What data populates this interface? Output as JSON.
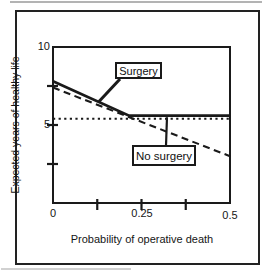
{
  "colors": {
    "ink": "#1a1a1a",
    "background": "#ffffff"
  },
  "chart_data": {
    "type": "line",
    "title": "",
    "xlabel": "Probability of operative death",
    "ylabel": "Expected years of healthy life",
    "xlim": [
      0,
      0.5
    ],
    "ylim": [
      0,
      10
    ],
    "grid": false,
    "legend_position": "inline-callouts",
    "x_axis": {
      "ticks": [
        {
          "value": 0,
          "label": "0"
        },
        {
          "value": 0.125,
          "label": ""
        },
        {
          "value": 0.25,
          "label": "0.25"
        },
        {
          "value": 0.375,
          "label": ""
        },
        {
          "value": 0.5,
          "label": "0.5"
        }
      ]
    },
    "y_axis": {
      "ticks": [
        {
          "value": 10,
          "label": "10"
        },
        {
          "value": 7.5,
          "label": ""
        },
        {
          "value": 5,
          "label": "5"
        },
        {
          "value": 2.5,
          "label": ""
        }
      ]
    },
    "series": [
      {
        "name": "surgery-dashed",
        "label": "Surgery",
        "line_style": "dashed",
        "points": [
          [
            0,
            7.4
          ],
          [
            0.5,
            3.0
          ]
        ]
      },
      {
        "name": "surgery-solid",
        "label": "Surgery",
        "line_style": "solid",
        "points": [
          [
            0,
            7.8
          ],
          [
            0.215,
            5.6
          ],
          [
            0.5,
            5.6
          ]
        ]
      },
      {
        "name": "no-surgery-dotted",
        "label": "No surgery",
        "line_style": "dotted",
        "points": [
          [
            0,
            5.4
          ],
          [
            0.5,
            5.4
          ]
        ]
      }
    ],
    "annotations": [
      {
        "label": "Surgery",
        "anchor_x": 0.13,
        "anchor_y": 6.5
      },
      {
        "label": "No surgery",
        "anchor_x": 0.322,
        "anchor_y": 5.5
      }
    ]
  }
}
